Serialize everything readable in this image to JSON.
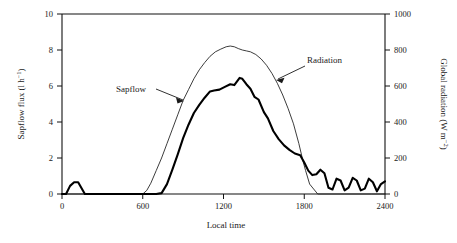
{
  "chart_data": {
    "type": "line",
    "title": "",
    "subtitle": "",
    "xlabel": "Local time",
    "ylabel": "Sapflow flux (l h⁻¹)",
    "y2label": "Global radiation (W m⁻²)",
    "xlim": [
      0,
      2400
    ],
    "ylim": [
      0,
      10
    ],
    "y2lim": [
      0,
      1000
    ],
    "grid": false,
    "legend_position": "inline-annotations",
    "xticks": [
      0,
      600,
      1200,
      1800,
      2400
    ],
    "xticklabels": [
      "0",
      "600",
      "1200",
      "1800",
      "2400"
    ],
    "yticks": [
      0,
      2,
      4,
      6,
      8,
      10
    ],
    "yticklabels": [
      "0",
      "2",
      "4",
      "6",
      "8",
      "10"
    ],
    "y2ticks": [
      0,
      200,
      400,
      600,
      800,
      1000
    ],
    "y2ticklabels": [
      "0",
      "200",
      "400",
      "600",
      "800",
      "1000"
    ],
    "annotations": [
      {
        "text": "Sapflow",
        "x": 690,
        "y": 5.35,
        "target_x": 960,
        "target_y": 4.65
      },
      {
        "text": "Radiation",
        "x": 1710,
        "y": 7.35,
        "target_x": 1470,
        "target_y": 5.95
      }
    ],
    "series": [
      {
        "name": "Radiation",
        "axis": "right",
        "style": "thin",
        "units": "W m-2",
        "x": [
          0,
          60,
          120,
          180,
          240,
          300,
          360,
          420,
          480,
          540,
          600,
          630,
          660,
          700,
          740,
          780,
          820,
          860,
          900,
          940,
          980,
          1020,
          1060,
          1100,
          1140,
          1180,
          1220,
          1250,
          1280,
          1310,
          1340,
          1370,
          1400,
          1440,
          1480,
          1520,
          1560,
          1600,
          1640,
          1680,
          1720,
          1760,
          1790,
          1810,
          1840,
          1900,
          2000,
          2100,
          2200,
          2300,
          2400
        ],
        "values": [
          0,
          0,
          0,
          0,
          0,
          0,
          0,
          0,
          0,
          0,
          0,
          20,
          60,
          130,
          200,
          280,
          360,
          440,
          520,
          580,
          640,
          690,
          730,
          765,
          790,
          805,
          818,
          822,
          818,
          808,
          800,
          795,
          790,
          775,
          750,
          715,
          670,
          615,
          550,
          475,
          390,
          280,
          185,
          130,
          55,
          0,
          0,
          0,
          0,
          0,
          0
        ]
      },
      {
        "name": "Sapflow",
        "axis": "left",
        "style": "bold",
        "units": "l h-1",
        "x": [
          0,
          30,
          60,
          90,
          120,
          170,
          200,
          300,
          400,
          500,
          600,
          700,
          740,
          780,
          820,
          860,
          900,
          940,
          980,
          1020,
          1060,
          1100,
          1130,
          1170,
          1210,
          1250,
          1280,
          1320,
          1340,
          1370,
          1400,
          1430,
          1460,
          1500,
          1530,
          1570,
          1610,
          1650,
          1690,
          1730,
          1770,
          1800,
          1830,
          1860,
          1890,
          1920,
          1950,
          1980,
          2010,
          2040,
          2070,
          2100,
          2130,
          2160,
          2190,
          2220,
          2250,
          2280,
          2310,
          2340,
          2370,
          2400
        ],
        "values": [
          0,
          0,
          0.45,
          0.65,
          0.65,
          0.0,
          0,
          0,
          0,
          0,
          0,
          0,
          0.05,
          0.55,
          1.35,
          2.2,
          3.1,
          3.85,
          4.5,
          4.95,
          5.35,
          5.7,
          5.75,
          5.8,
          5.95,
          6.1,
          6.05,
          6.45,
          6.4,
          6.1,
          5.85,
          5.4,
          5.25,
          4.55,
          4.2,
          3.5,
          3.05,
          2.7,
          2.45,
          2.25,
          2.15,
          1.75,
          1.3,
          1.05,
          1.1,
          1.35,
          1.15,
          0.35,
          0.25,
          0.85,
          0.75,
          0.2,
          0.35,
          0.9,
          0.75,
          0.2,
          0.3,
          0.85,
          0.65,
          0.15,
          0.55,
          0.7
        ]
      }
    ]
  },
  "labels": {
    "y_axis_main": "Sapflow flux (l h",
    "y_axis_exp": "−1",
    "y_axis_tail": ")",
    "y2_axis_main": "Global radiation (W m",
    "y2_axis_exp": "−2",
    "y2_axis_tail": ")",
    "x_axis_title": "Local time",
    "annotation_sapflow": "Sapflow",
    "annotation_radiation": "Radiation"
  },
  "colors": {
    "axis": "#111111",
    "sapflow_line": "#000000",
    "radiation_line": "#1a1a1a",
    "background": "#ffffff"
  }
}
